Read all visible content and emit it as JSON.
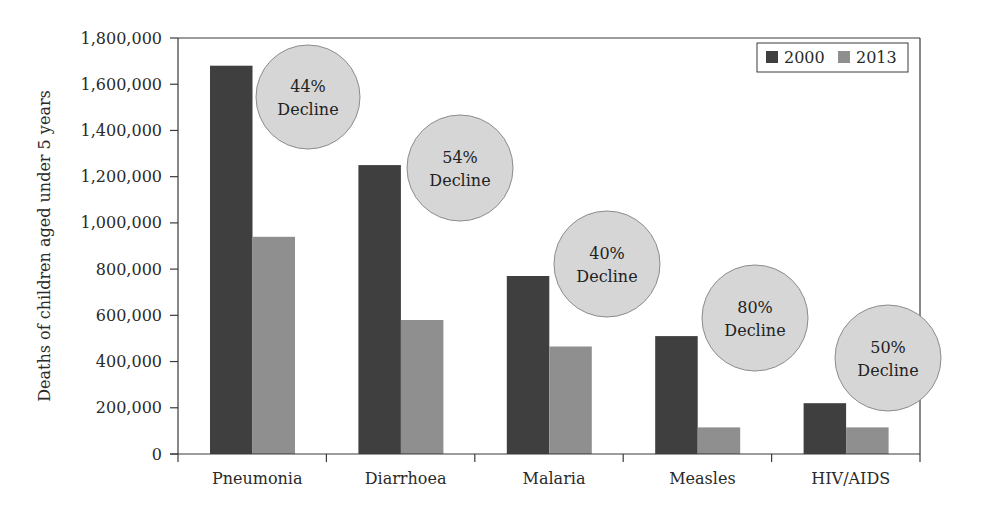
{
  "chart_data": {
    "type": "bar",
    "title": "",
    "xlabel": "",
    "ylabel": "Deaths of children aged under 5 years",
    "ylim": [
      0,
      1800000
    ],
    "yticks": [
      0,
      200000,
      400000,
      600000,
      800000,
      1000000,
      1200000,
      1400000,
      1600000,
      1800000
    ],
    "ytick_labels": [
      "0",
      "200,000",
      "400,000",
      "600,000",
      "800,000",
      "1,000,000",
      "1,200,000",
      "1,400,000",
      "1,600,000",
      "1,800,000"
    ],
    "categories": [
      "Pneumonia",
      "Diarrhoea",
      "Malaria",
      "Measles",
      "HIV/AIDS"
    ],
    "series": [
      {
        "name": "2000",
        "color": "#3f3f3f",
        "values": [
          1680000,
          1250000,
          770000,
          510000,
          220000
        ]
      },
      {
        "name": "2013",
        "color": "#8f8f8f",
        "values": [
          940000,
          580000,
          465000,
          115000,
          115000
        ]
      }
    ],
    "annotations": [
      {
        "category": "Pneumonia",
        "line1": "44%",
        "line2": "Decline",
        "cx": 308,
        "cy": 97,
        "r": 52
      },
      {
        "category": "Diarrhoea",
        "line1": "54%",
        "line2": "Decline",
        "cx": 460,
        "cy": 168,
        "r": 53
      },
      {
        "category": "Malaria",
        "line1": "40%",
        "line2": "Decline",
        "cx": 607,
        "cy": 264,
        "r": 53
      },
      {
        "category": "Measles",
        "line1": "80%",
        "line2": "Decline",
        "cx": 755,
        "cy": 318,
        "r": 53
      },
      {
        "category": "HIV/AIDS",
        "line1": "50%",
        "line2": "Decline",
        "cx": 888,
        "cy": 358,
        "r": 53
      }
    ],
    "legend": {
      "position": "top-right",
      "entries": [
        "2000",
        "2013"
      ]
    },
    "grid": false,
    "colors": {
      "bubble_fill": "#d6d6d6",
      "bubble_stroke": "#8c8c8c",
      "axis": "#3a3a3a"
    }
  }
}
